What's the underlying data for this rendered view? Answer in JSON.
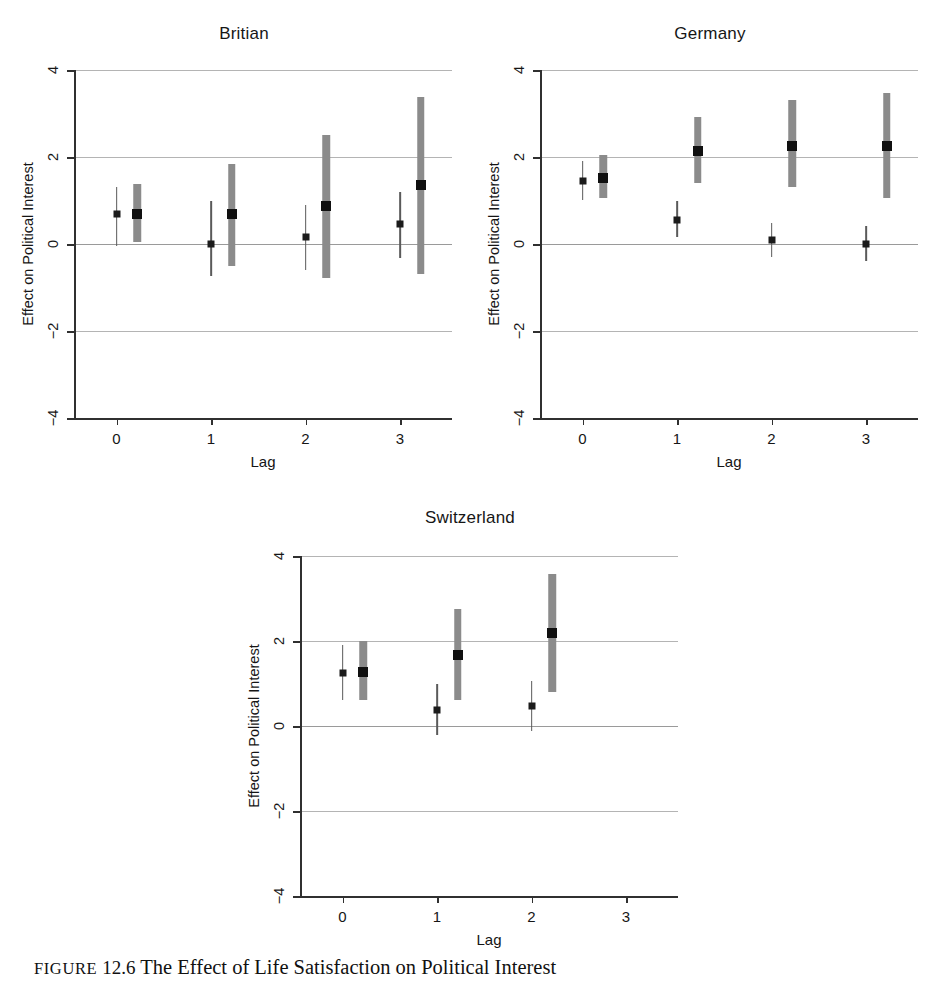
{
  "caption": {
    "label": "FIGURE",
    "number": "12.6",
    "text": "The Effect of Life Satisfaction on Political Interest"
  },
  "colors": {
    "thin_interval": "#5a5a5a",
    "thick_interval": "#8b8b8b",
    "point": "#151515",
    "gridline": "#b4b4b4",
    "axis": "#303030"
  },
  "chart_data": [
    {
      "type": "scatter",
      "title": "Britian",
      "xlabel": "Lag",
      "ylabel": "Effect on Political Interest",
      "xticks": [
        "0",
        "1",
        "2",
        "3"
      ],
      "yticks": [
        "4",
        "2",
        "0",
        "-2",
        "-4"
      ],
      "xlim": [
        -0.45,
        3.55
      ],
      "ylim": [
        -4,
        4
      ],
      "grid": true,
      "legend": "none",
      "series": [
        {
          "name": "narrow interval",
          "marker": "small-square",
          "style": "thin-line",
          "points": [
            {
              "x": 0,
              "estimate": 0.68,
              "low": -0.05,
              "high": 1.32
            },
            {
              "x": 1,
              "estimate": 0.0,
              "low": -0.73,
              "high": 1.0
            },
            {
              "x": 2,
              "estimate": 0.17,
              "low": -0.6,
              "high": 0.9
            },
            {
              "x": 3,
              "estimate": 0.45,
              "low": -0.32,
              "high": 1.2
            }
          ]
        },
        {
          "name": "wide interval",
          "marker": "large-square",
          "style": "thick-bar",
          "points": [
            {
              "x": 0.22,
              "estimate": 0.7,
              "low": 0.05,
              "high": 1.37
            },
            {
              "x": 1.22,
              "estimate": 0.69,
              "low": -0.5,
              "high": 1.85
            },
            {
              "x": 2.22,
              "estimate": 0.88,
              "low": -0.78,
              "high": 2.5
            },
            {
              "x": 3.22,
              "estimate": 1.35,
              "low": -0.68,
              "high": 3.38
            }
          ]
        }
      ]
    },
    {
      "type": "scatter",
      "title": "Germany",
      "xlabel": "Lag",
      "ylabel": "Effect on Political Interest",
      "xticks": [
        "0",
        "1",
        "2",
        "3"
      ],
      "yticks": [
        "4",
        "2",
        "0",
        "-2",
        "-4"
      ],
      "xlim": [
        -0.45,
        3.55
      ],
      "ylim": [
        -4,
        4
      ],
      "grid": true,
      "legend": "none",
      "series": [
        {
          "name": "narrow interval",
          "marker": "small-square",
          "style": "thin-line",
          "points": [
            {
              "x": 0,
              "estimate": 1.45,
              "low": 1.0,
              "high": 1.9
            },
            {
              "x": 1,
              "estimate": 0.55,
              "low": 0.17,
              "high": 0.98
            },
            {
              "x": 2,
              "estimate": 0.1,
              "low": -0.3,
              "high": 0.48
            },
            {
              "x": 3,
              "estimate": 0.0,
              "low": -0.4,
              "high": 0.42
            }
          ]
        },
        {
          "name": "wide interval",
          "marker": "large-square",
          "style": "thick-bar",
          "points": [
            {
              "x": 0.22,
              "estimate": 1.52,
              "low": 1.05,
              "high": 2.05
            },
            {
              "x": 1.22,
              "estimate": 2.13,
              "low": 1.4,
              "high": 2.92
            },
            {
              "x": 2.22,
              "estimate": 2.25,
              "low": 1.3,
              "high": 3.3
            },
            {
              "x": 3.22,
              "estimate": 2.25,
              "low": 1.05,
              "high": 3.47
            }
          ]
        }
      ]
    },
    {
      "type": "scatter",
      "title": "Switzerland",
      "xlabel": "Lag",
      "ylabel": "Effect on Political Interest",
      "xticks": [
        "0",
        "1",
        "2",
        "3"
      ],
      "yticks": [
        "4",
        "2",
        "0",
        "-2",
        "-4"
      ],
      "xlim": [
        -0.45,
        3.55
      ],
      "ylim": [
        -4,
        4
      ],
      "grid": true,
      "legend": "none",
      "series": [
        {
          "name": "narrow interval",
          "marker": "small-square",
          "style": "thin-line",
          "points": [
            {
              "x": 0,
              "estimate": 1.25,
              "low": 0.62,
              "high": 1.9
            },
            {
              "x": 1,
              "estimate": 0.38,
              "low": -0.22,
              "high": 1.0
            },
            {
              "x": 2,
              "estimate": 0.48,
              "low": -0.12,
              "high": 1.07
            }
          ]
        },
        {
          "name": "wide interval",
          "marker": "large-square",
          "style": "thick-bar",
          "points": [
            {
              "x": 0.22,
              "estimate": 1.27,
              "low": 0.62,
              "high": 2.0
            },
            {
              "x": 1.22,
              "estimate": 1.68,
              "low": 0.62,
              "high": 2.75
            },
            {
              "x": 2.22,
              "estimate": 2.18,
              "low": 0.8,
              "high": 3.58
            }
          ]
        }
      ]
    }
  ]
}
